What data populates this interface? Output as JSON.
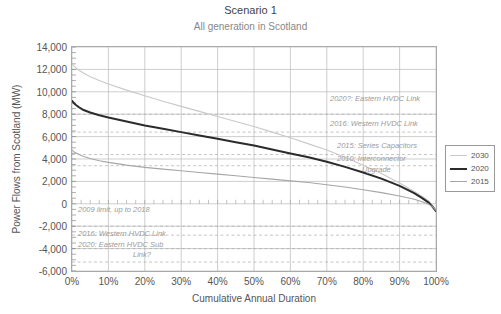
{
  "chart_data": {
    "type": "line",
    "title": "Scenario 1",
    "subtitle": "All generation in Scotland",
    "xlabel": "Cumulative Annual Duration",
    "ylabel": "Power Flows from Scotland (MW)",
    "xlim": [
      0,
      100
    ],
    "ylim": [
      -6000,
      14000
    ],
    "xticks": [
      "0%",
      "10%",
      "20%",
      "30%",
      "40%",
      "50%",
      "60%",
      "70%",
      "80%",
      "90%",
      "100%"
    ],
    "yticks": [
      "14,000",
      "12,000",
      "10,000",
      "8,000",
      "6,000",
      "4,000",
      "2,000",
      "0",
      "-2,000",
      "-4,000",
      "-6,000"
    ],
    "grid": true,
    "legend_position": "right",
    "series": [
      {
        "name": "2030",
        "color": "#c9c9c9",
        "width": 1.1,
        "x": [
          0,
          1,
          2,
          3,
          5,
          7.5,
          10,
          15,
          20,
          25,
          30,
          35,
          40,
          45,
          50,
          55,
          60,
          65,
          70,
          75,
          80,
          85,
          90,
          94,
          96,
          98,
          99,
          99.5,
          100
        ],
        "y": [
          12500,
          12150,
          11900,
          11700,
          11350,
          11000,
          10700,
          10150,
          9650,
          9150,
          8700,
          8250,
          7800,
          7350,
          6900,
          6400,
          5900,
          5350,
          4800,
          4150,
          3450,
          2700,
          1850,
          1100,
          700,
          250,
          -100,
          -350,
          -600
        ]
      },
      {
        "name": "2020",
        "color": "#2b2b2b",
        "width": 2.0,
        "x": [
          0,
          0.5,
          1,
          2,
          3,
          5,
          7.5,
          10,
          15,
          20,
          25,
          30,
          35,
          40,
          45,
          50,
          55,
          60,
          65,
          70,
          75,
          80,
          85,
          90,
          94,
          96,
          98,
          99,
          99.5,
          100
        ],
        "y": [
          9200,
          9000,
          8850,
          8600,
          8400,
          8150,
          7900,
          7700,
          7350,
          7000,
          6700,
          6400,
          6100,
          5800,
          5500,
          5200,
          4850,
          4500,
          4150,
          3750,
          3300,
          2800,
          2250,
          1600,
          950,
          550,
          100,
          -250,
          -450,
          -650
        ]
      },
      {
        "name": "2015",
        "color": "#a6a6a6",
        "width": 1.1,
        "x": [
          0,
          0.5,
          1,
          2,
          3,
          5,
          7.5,
          10,
          15,
          20,
          25,
          30,
          35,
          40,
          45,
          50,
          55,
          60,
          65,
          70,
          75,
          80,
          85,
          90,
          94,
          96,
          98,
          99,
          99.5,
          100
        ],
        "y": [
          4800,
          4650,
          4550,
          4400,
          4250,
          4050,
          3850,
          3700,
          3450,
          3250,
          3100,
          2950,
          2800,
          2650,
          2500,
          2350,
          2200,
          2050,
          1900,
          1700,
          1500,
          1250,
          1000,
          700,
          400,
          200,
          -50,
          -250,
          -400,
          -600
        ]
      }
    ],
    "reference_lines": [
      {
        "value": 8000,
        "style": "dashed"
      },
      {
        "value": 6400,
        "style": "dashed"
      },
      {
        "value": 4400,
        "style": "dashed"
      },
      {
        "value": 3400,
        "style": "dashed"
      },
      {
        "value": -2000,
        "style": "dashed"
      },
      {
        "value": -2800,
        "style": "dashed"
      },
      {
        "value": -4000,
        "style": "dashed"
      },
      {
        "value": -5200,
        "style": "dashed"
      }
    ],
    "annotations": [
      {
        "id": "eastern-hvdc-link-2020",
        "text": "2020?: Eastern HVDC Link",
        "x": 330,
        "y": 95,
        "align": "left"
      },
      {
        "id": "western-hvdc-link-2016",
        "text": "2016: Western HVDC Link",
        "x": 330,
        "y": 120,
        "align": "left"
      },
      {
        "id": "series-capacitors-2015",
        "text": "2015: Series Capacitors",
        "x": 337,
        "y": 142,
        "align": "left"
      },
      {
        "id": "interconnector-upgrade-2010-line1",
        "text": "2010: Interconnector",
        "x": 337,
        "y": 155,
        "align": "left"
      },
      {
        "id": "interconnector-upgrade-2010-line2",
        "text": "Upgrade",
        "x": 362,
        "y": 166,
        "align": "left"
      },
      {
        "id": "limit-2009-up-to-2018",
        "text": "2009 limit, up to 2018",
        "x": 78,
        "y": 206,
        "align": "left"
      },
      {
        "id": "western-hvdc-link-2016-lower",
        "text": "2016: Western HVDC Link",
        "x": 78,
        "y": 230,
        "align": "left"
      },
      {
        "id": "eastern-hvdc-sub-link-2020-line1",
        "text": "2020: Eastern HVDC Sub",
        "x": 78,
        "y": 241,
        "align": "left"
      },
      {
        "id": "eastern-hvdc-sub-link-2020-line2",
        "text": "Link?",
        "x": 133,
        "y": 251,
        "align": "left"
      }
    ],
    "legend": [
      {
        "label": "2030",
        "color": "#c9c9c9",
        "width": 1.1
      },
      {
        "label": "2020",
        "color": "#2b2b2b",
        "width": 2.0
      },
      {
        "label": "2015",
        "color": "#a6a6a6",
        "width": 1.1
      }
    ]
  }
}
